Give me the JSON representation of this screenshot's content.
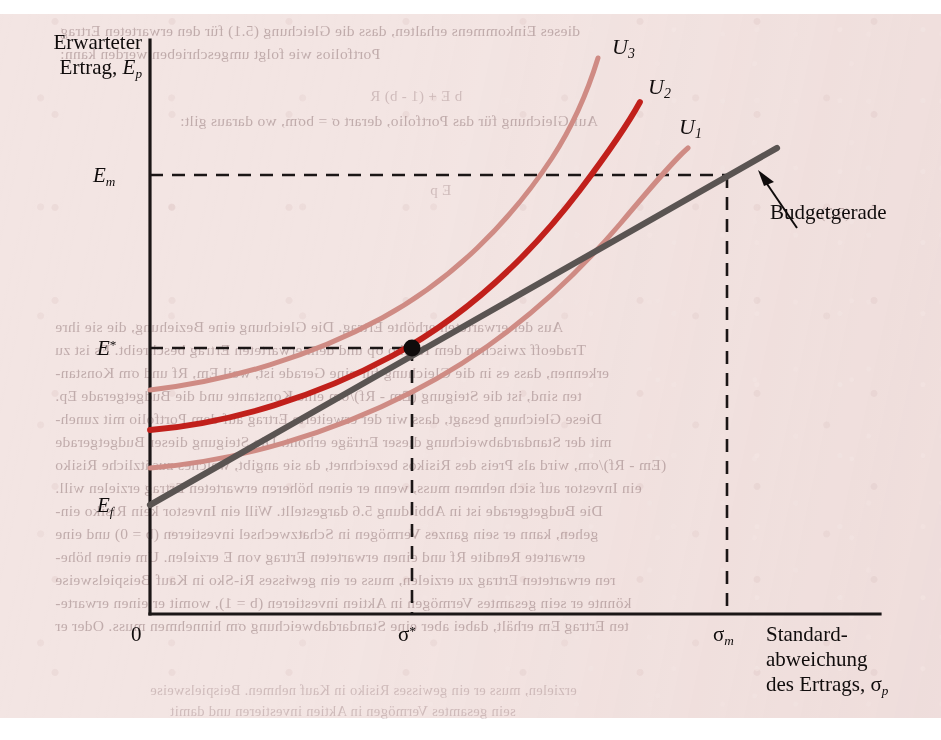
{
  "figure": {
    "background_color": "#f3e5e3",
    "axis_color": "#1b1616",
    "budget_line_color": "#5a5452",
    "curve_color_light": "#cf8b84",
    "curve_color_dark": "#c1201b",
    "point_color": "#100c0c"
  },
  "axes": {
    "y_title_line1": "Erwarteter",
    "y_title_line2": "Ertrag, ",
    "y_title_symbol": "E",
    "y_title_symbol_sub": "p",
    "x_title_line1": "Standard-",
    "x_title_line2": "abweichung",
    "x_title_line3": "des Ertrags, ",
    "x_title_symbol": "σ",
    "x_title_symbol_sub": "p",
    "origin_label": "0"
  },
  "y_ticks": [
    {
      "name": "E-m",
      "symbol": "E",
      "sub": "m",
      "sup": "",
      "value_px": 175
    },
    {
      "name": "E-star",
      "symbol": "E",
      "sub": "",
      "sup": "*",
      "value_px": 348
    },
    {
      "name": "E-f",
      "symbol": "E",
      "sub": "f",
      "sup": "",
      "value_px": 505
    }
  ],
  "x_ticks": [
    {
      "name": "sigma-star",
      "symbol": "σ",
      "sub": "",
      "sup": "*",
      "value_px": 412
    },
    {
      "name": "sigma-m",
      "symbol": "σ",
      "sub": "m",
      "sup": "",
      "value_px": 727
    }
  ],
  "curves": [
    {
      "label": "U",
      "sub": "3",
      "label_x": 612,
      "label_y": 34,
      "color": "#cf8b84",
      "width": 5.0
    },
    {
      "label": "U",
      "sub": "2",
      "label_x": 648,
      "label_y": 74,
      "color": "#c1201b",
      "width": 5.6
    },
    {
      "label": "U",
      "sub": "1",
      "label_x": 679,
      "label_y": 114,
      "color": "#cf8b84",
      "width": 5.0
    }
  ],
  "annotations": [
    {
      "name": "budget-line-callout",
      "text": "Budgetgerade",
      "x": 770,
      "y": 200
    }
  ],
  "chart_data": {
    "type": "line",
    "title": "",
    "xlabel": "Standardabweichung des Ertrags, σp",
    "ylabel": "Erwarteter Ertrag, Ep",
    "grid": false,
    "legend": "inline-curve-labels",
    "xlim_px": [
      150,
      880
    ],
    "ylim_px": [
      614,
      40
    ],
    "plot_box_px": {
      "left": 150,
      "right": 880,
      "top": 40,
      "bottom": 614
    },
    "xtick_labels": [
      "0",
      "σ*",
      "σm"
    ],
    "ytick_labels": [
      "Em",
      "E*",
      "Ef"
    ],
    "series": [
      {
        "name": "Budgetgerade",
        "kind": "line",
        "color": "#5a5452",
        "points_px": [
          [
            150,
            505
          ],
          [
            412,
            348
          ],
          [
            727,
            175
          ],
          [
            777,
            148
          ]
        ]
      },
      {
        "name": "U1",
        "kind": "indifference-curve",
        "color": "#cf8b84",
        "points_px": [
          [
            150,
            468
          ],
          [
            220,
            462
          ],
          [
            300,
            448
          ],
          [
            370,
            428
          ],
          [
            440,
            400
          ],
          [
            510,
            362
          ],
          [
            570,
            320
          ],
          [
            620,
            272
          ],
          [
            660,
            214
          ],
          [
            688,
            148
          ]
        ]
      },
      {
        "name": "U2",
        "kind": "indifference-curve",
        "color": "#c1201b",
        "points_px": [
          [
            150,
            430
          ],
          [
            220,
            424
          ],
          [
            300,
            408
          ],
          [
            370,
            383
          ],
          [
            440,
            348
          ],
          [
            500,
            308
          ],
          [
            550,
            262
          ],
          [
            590,
            212
          ],
          [
            620,
            158
          ],
          [
            640,
            102
          ]
        ]
      },
      {
        "name": "U3",
        "kind": "indifference-curve",
        "color": "#cf8b84",
        "points_px": [
          [
            150,
            390
          ],
          [
            215,
            382
          ],
          [
            285,
            364
          ],
          [
            350,
            338
          ],
          [
            410,
            304
          ],
          [
            465,
            262
          ],
          [
            512,
            214
          ],
          [
            550,
            160
          ],
          [
            578,
            104
          ],
          [
            598,
            58
          ]
        ]
      }
    ],
    "annotated_points": [
      {
        "name": "optimal-portfolio",
        "label": "",
        "x_px": 412,
        "y_px": 348,
        "marker": "filled-circle"
      }
    ],
    "dashed_guides": [
      {
        "name": "E-star-horizontal",
        "from_px": [
          150,
          348
        ],
        "to_px": [
          412,
          348
        ]
      },
      {
        "name": "sigma-star-vertical",
        "from_px": [
          412,
          348
        ],
        "to_px": [
          412,
          614
        ]
      },
      {
        "name": "E-m-horizontal",
        "from_px": [
          150,
          175
        ],
        "to_px": [
          727,
          175
        ]
      },
      {
        "name": "sigma-m-vertical",
        "from_px": [
          727,
          175
        ],
        "to_px": [
          727,
          614
        ]
      }
    ]
  },
  "bleed_text": {
    "lines": [
      {
        "text": "dieses Einkommens erhalten, dass die Gleichung (5.1) für den erwarteten Ertrag",
        "x": 60,
        "y": 22,
        "size": 15.5,
        "strong": true
      },
      {
        "text": "Portfolios wie folgt umgeschrieben werden kann:",
        "x": 60,
        "y": 45,
        "size": 15.5,
        "strong": true
      },
      {
        "text": "b E + (1 - b) R",
        "x": 370,
        "y": 88,
        "size": 15,
        "strong": false
      },
      {
        "text": "Auf Gleichung für das Portfolio, derart σ = bσm, wo daraus gilt:",
        "x": 180,
        "y": 112,
        "size": 15.5,
        "strong": true
      },
      {
        "text": "(5.3)",
        "x": 820,
        "y": 205,
        "size": 15,
        "strong": true
      },
      {
        "text": "E p",
        "x": 430,
        "y": 182,
        "size": 15,
        "strong": false
      },
      {
        "text": "Aus der erwarteten erhöhte Ertrag. Die Gleichung eine Beziehung, die sie ihre",
        "x": 55,
        "y": 318,
        "size": 15.5,
        "strong": true
      },
      {
        "text": "Tradeoff zwischen dem Risiko σp und dem erwarteten Ertrag beschreibt. Es ist zu",
        "x": 55,
        "y": 341,
        "size": 15.5,
        "strong": true
      },
      {
        "text": "erkennen, dass es in die Gleichung für eine Gerade ist, weil Em, Rf und σm Konstan-",
        "x": 55,
        "y": 364,
        "size": 15.5,
        "strong": true
      },
      {
        "text": "ten sind, ist die Steigung (Em - Rf)/σm eine Konstante und die Budgetgerade Ep.",
        "x": 55,
        "y": 387,
        "size": 15.5,
        "strong": true
      },
      {
        "text": "Diese Gleichung besagt, dass wir der erweiterte Ertrag auf dem Portfolio mit zuneh-",
        "x": 55,
        "y": 410,
        "size": 15.5,
        "strong": true
      },
      {
        "text": "mit der Standardabweichung dieser Erträge erhöht. Die Steigung dieser Budgetgerade",
        "x": 55,
        "y": 433,
        "size": 15.5,
        "strong": true
      },
      {
        "text": "(Em - Rf)/σm, wird als Preis des Risikos bezeichnet, da sie angibt, welches zusätzliche Risiko",
        "x": 55,
        "y": 456,
        "size": 15.5,
        "strong": true
      },
      {
        "text": "ein Investor auf sich nehmen muss, wenn er einen höheren erwarteten Ertrag erzielen will.",
        "x": 55,
        "y": 479,
        "size": 15.5,
        "strong": true
      },
      {
        "text": "Die Budgetgerade ist in Abbildung 5.6 dargestellt. Will ein Investor kein Risiko ein-",
        "x": 55,
        "y": 502,
        "size": 15.5,
        "strong": true
      },
      {
        "text": "gehen, kann er sein ganzes Vermögen in Schatzwechsel investieren (b = 0) und eine",
        "x": 55,
        "y": 525,
        "size": 15.5,
        "strong": true
      },
      {
        "text": "erwartete Rendite Rf und einen erwarteten Ertrag von E erzielen. Um einen höhe-",
        "x": 55,
        "y": 548,
        "size": 15.5,
        "strong": true
      },
      {
        "text": "ren erwarteten Ertrag zu erzielen, muss er ein gewisses Ri-Sko in Kauf Beispielsweise",
        "x": 55,
        "y": 571,
        "size": 15.5,
        "strong": true
      },
      {
        "text": "könnte er sein gesamtes Vermögen in Aktien investieren (b = 1), womit er einen erwarte-",
        "x": 55,
        "y": 594,
        "size": 15.5,
        "strong": true
      },
      {
        "text": "ten Ertrag Em erhält, dabei aber eine Standardabweichung σm hinnehmen muss. Oder er",
        "x": 55,
        "y": 617,
        "size": 15.5,
        "strong": true
      },
      {
        "text": "erzielen, muss er ein gewisses Risiko in Kauf nehmen. Beispielsweise",
        "x": 150,
        "y": 682,
        "size": 14.5,
        "strong": false
      },
      {
        "text": "sein gesamtes Vermögen in Aktien investieren und damit",
        "x": 170,
        "y": 703,
        "size": 14.5,
        "strong": false
      }
    ]
  }
}
